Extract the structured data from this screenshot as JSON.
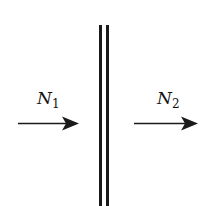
{
  "diagram": {
    "type": "flux-through-membrane",
    "barrier": {
      "description": "double vertical wall",
      "color": "#1a1a1a"
    },
    "arrows": [
      {
        "id": "incoming",
        "label_main": "N",
        "label_sub": "1",
        "direction": "right",
        "side": "left"
      },
      {
        "id": "outgoing",
        "label_main": "N",
        "label_sub": "2",
        "direction": "right",
        "side": "right"
      }
    ],
    "colors": {
      "ink": "#1a1a1a",
      "background": "#ffffff"
    }
  }
}
